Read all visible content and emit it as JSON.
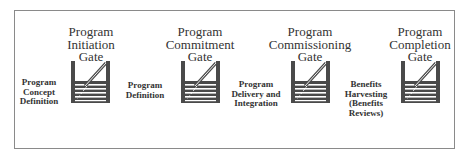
{
  "diagram": {
    "stages": [
      {
        "lines": [
          "Program",
          "Concept",
          "Definition"
        ]
      },
      {
        "lines": [
          "Program",
          "Definition"
        ]
      },
      {
        "lines": [
          "Program",
          "Delivery and",
          "Integration"
        ]
      },
      {
        "lines": [
          "Benefits",
          "Harvesting",
          "(Benefits",
          "Reviews)"
        ]
      }
    ],
    "gates": [
      {
        "lines": [
          "Program",
          "Initiation",
          "Gate"
        ],
        "icon": "gate-icon"
      },
      {
        "lines": [
          "Program",
          "Commitment",
          "Gate"
        ],
        "icon": "gate-icon"
      },
      {
        "lines": [
          "Program",
          "Commissioning",
          "Gate"
        ],
        "icon": "gate-icon"
      },
      {
        "lines": [
          "Program",
          "Completion",
          "Gate"
        ],
        "icon": "gate-icon"
      }
    ],
    "colors": {
      "frame": "#8a8a8a",
      "gate_fill": "#4a4a4a",
      "text": "#333333"
    }
  }
}
